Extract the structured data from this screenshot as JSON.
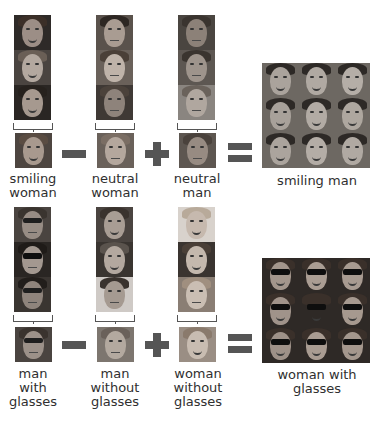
{
  "diagram": {
    "colors": {
      "operator": "#555555",
      "text": "#2f2f2f",
      "background": "#ffffff"
    },
    "equations": [
      {
        "terms": [
          {
            "label": "smiling\nwoman",
            "stack": [
              "smiling woman 1",
              "smiling woman 2",
              "smiling woman 3"
            ],
            "average": "smiling woman average"
          },
          {
            "label": "neutral\nwoman",
            "stack": [
              "neutral woman 1",
              "neutral woman 2",
              "neutral woman 3"
            ],
            "average": "neutral woman average"
          },
          {
            "label": "neutral\nman",
            "stack": [
              "neutral man 1",
              "neutral man 2",
              "neutral man 3"
            ],
            "average": "neutral man average"
          }
        ],
        "operators": [
          "minus",
          "plus",
          "equals"
        ],
        "result": {
          "label": "smiling man",
          "grid_rows": 3,
          "grid_cols": 3
        }
      },
      {
        "terms": [
          {
            "label": "man\nwith\nglasses",
            "stack": [
              "man with glasses 1",
              "man with glasses 2",
              "man with glasses 3"
            ],
            "average": "man with glasses average"
          },
          {
            "label": "man\nwithout\nglasses",
            "stack": [
              "man without glasses 1",
              "man without glasses 2",
              "man without glasses 3"
            ],
            "average": "man without glasses average"
          },
          {
            "label": "woman\nwithout\nglasses",
            "stack": [
              "woman without glasses 1",
              "woman without glasses 2",
              "woman without glasses 3"
            ],
            "average": "woman without glasses average"
          }
        ],
        "operators": [
          "minus",
          "plus",
          "equals"
        ],
        "result": {
          "label": "woman with\nglasses",
          "grid_rows": 3,
          "grid_cols": 3
        }
      }
    ]
  }
}
